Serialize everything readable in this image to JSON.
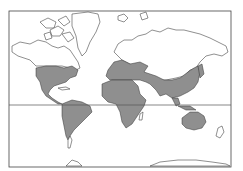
{
  "map": {
    "projection": "mercator",
    "type": "world distribution map",
    "frame": {
      "x": 9,
      "y": 11,
      "width": 222,
      "height": 156
    },
    "equator_y": 105,
    "colors": {
      "background": "#ffffff",
      "land_fill": "#ffffff",
      "coastline": "#333333",
      "range_fill": "#8f8f8f",
      "frame": "#444444"
    },
    "legend": null,
    "shaded_regions": [
      "North America (USA, Mexico, Central America)",
      "South America",
      "Europe",
      "Africa",
      "Middle East",
      "Central Asia",
      "South Asia",
      "East Asia",
      "Southeast Asia",
      "Australia"
    ],
    "unshaded_regions": [
      "Canada & Alaska",
      "Greenland",
      "Arctic islands",
      "Scandinavia north / Siberia",
      "Southern tip of South America",
      "New Zealand",
      "Antarctica"
    ]
  }
}
